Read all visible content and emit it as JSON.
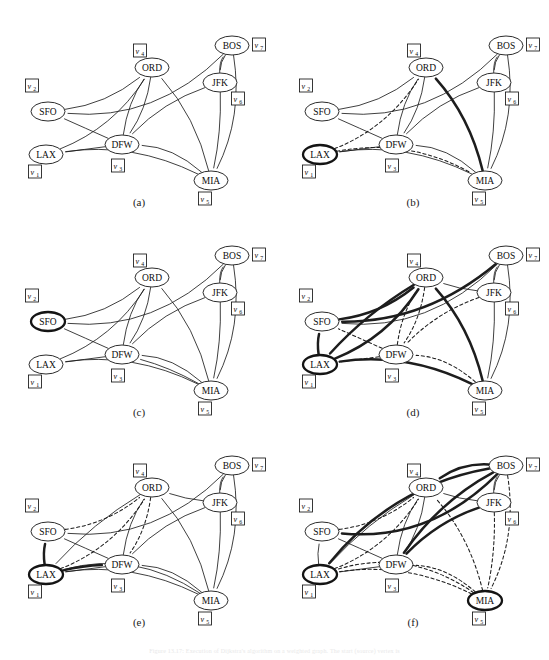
{
  "figure": {
    "type": "graph-diagram-grid",
    "panel_count": 6,
    "bottom_note": "Figure 13.17:  Execution of Dijkstra's algorithm on a weighted graph. The start (source) vertex is"
  },
  "captions": [
    "(a)",
    "(b)",
    "(c)",
    "(d)",
    "(e)",
    "(f)"
  ],
  "nodes": [
    {
      "id": "SFO",
      "label": "SFO",
      "vlabel": "v",
      "vsub": "2",
      "x": 46,
      "y": 100,
      "vx": 30,
      "vy": 74
    },
    {
      "id": "LAX",
      "label": "LAX",
      "vlabel": "v",
      "vsub": "1",
      "x": 44,
      "y": 143,
      "vx": 33,
      "vy": 160
    },
    {
      "id": "DFW",
      "label": "DFW",
      "vlabel": "v",
      "vsub": "3",
      "x": 120,
      "y": 133,
      "vx": 116,
      "vy": 154
    },
    {
      "id": "ORD",
      "label": "ORD",
      "vlabel": "v",
      "vsub": "4",
      "x": 150,
      "y": 56,
      "vx": 138,
      "vy": 39
    },
    {
      "id": "MIA",
      "label": "MIA",
      "vlabel": "v",
      "vsub": "5",
      "x": 209,
      "y": 169,
      "vx": 203,
      "vy": 187
    },
    {
      "id": "JFK",
      "label": "JFK",
      "vlabel": "v",
      "vsub": "6",
      "x": 218,
      "y": 71,
      "vx": 236,
      "vy": 87
    },
    {
      "id": "BOS",
      "label": "BOS",
      "vlabel": "v",
      "vsub": "7",
      "x": 230,
      "y": 34,
      "vx": 257,
      "vy": 33
    }
  ],
  "node_rx": 17,
  "node_ry": 9.5,
  "panels": [
    {
      "name": "a",
      "caption": "(a)",
      "highlight": [],
      "edges": [
        {
          "from": "BOS",
          "to": "SFO",
          "style": "solid",
          "bend": -46
        },
        {
          "from": "BOS",
          "to": "JFK",
          "style": "solid",
          "bend": 6
        },
        {
          "from": "JFK",
          "to": "BOS",
          "style": "solid",
          "bend": -7
        },
        {
          "from": "JFK",
          "to": "DFW",
          "style": "solid",
          "bend": 14
        },
        {
          "from": "JFK",
          "to": "MIA",
          "style": "solid",
          "bend": -6
        },
        {
          "from": "BOS",
          "to": "MIA",
          "style": "solid",
          "bend": -22
        },
        {
          "from": "MIA",
          "to": "DFW",
          "style": "solid",
          "bend": 17
        },
        {
          "from": "MIA",
          "to": "LAX",
          "style": "solid",
          "bend": 26
        },
        {
          "from": "DFW",
          "to": "ORD",
          "style": "solid",
          "bend": -10
        },
        {
          "from": "ORD",
          "to": "DFW",
          "style": "solid",
          "bend": -10
        },
        {
          "from": "MIA",
          "to": "ORD",
          "style": "solid",
          "bend": 16
        },
        {
          "from": "DFW",
          "to": "SFO",
          "style": "solid",
          "bend": 0
        },
        {
          "from": "DFW",
          "to": "LAX",
          "style": "solid",
          "bend": 0
        },
        {
          "from": "LAX",
          "to": "ORD",
          "style": "solid",
          "bend": 22
        },
        {
          "from": "SFO",
          "to": "ORD",
          "style": "solid",
          "bend": 16
        }
      ]
    },
    {
      "name": "b",
      "caption": "(b)",
      "highlight": [
        "LAX"
      ],
      "edges": [
        {
          "from": "BOS",
          "to": "SFO",
          "style": "solid",
          "bend": -46
        },
        {
          "from": "BOS",
          "to": "JFK",
          "style": "solid",
          "bend": 6
        },
        {
          "from": "JFK",
          "to": "BOS",
          "style": "solid",
          "bend": -7
        },
        {
          "from": "JFK",
          "to": "DFW",
          "style": "solid",
          "bend": 14
        },
        {
          "from": "JFK",
          "to": "MIA",
          "style": "solid",
          "bend": -6
        },
        {
          "from": "BOS",
          "to": "MIA",
          "style": "solid",
          "bend": -22
        },
        {
          "from": "MIA",
          "to": "DFW",
          "style": "solid",
          "bend": 17
        },
        {
          "from": "MIA",
          "to": "LAX",
          "style": "solid",
          "bend": 26
        },
        {
          "from": "DFW",
          "to": "ORD",
          "style": "solid",
          "bend": -10
        },
        {
          "from": "ORD",
          "to": "DFW",
          "style": "solid",
          "bend": -10
        },
        {
          "from": "MIA",
          "to": "ORD",
          "style": "bold",
          "bend": 16
        },
        {
          "from": "DFW",
          "to": "SFO",
          "style": "solid",
          "bend": 0
        },
        {
          "from": "DFW",
          "to": "LAX",
          "style": "solid",
          "bend": 0
        },
        {
          "from": "LAX",
          "to": "ORD",
          "style": "dashed",
          "bend": 22
        },
        {
          "from": "SFO",
          "to": "ORD",
          "style": "solid",
          "bend": 16
        },
        {
          "from": "LAX",
          "to": "MIA",
          "style": "dashed",
          "bend": -30
        }
      ]
    },
    {
      "name": "c",
      "caption": "(c)",
      "highlight": [
        "SFO"
      ],
      "edges": [
        {
          "from": "BOS",
          "to": "SFO",
          "style": "solid",
          "bend": -46
        },
        {
          "from": "BOS",
          "to": "JFK",
          "style": "solid",
          "bend": 6
        },
        {
          "from": "JFK",
          "to": "BOS",
          "style": "solid",
          "bend": -7
        },
        {
          "from": "JFK",
          "to": "DFW",
          "style": "solid",
          "bend": 14
        },
        {
          "from": "JFK",
          "to": "MIA",
          "style": "solid",
          "bend": -6
        },
        {
          "from": "BOS",
          "to": "MIA",
          "style": "solid",
          "bend": -22
        },
        {
          "from": "MIA",
          "to": "DFW",
          "style": "solid",
          "bend": 17
        },
        {
          "from": "MIA",
          "to": "LAX",
          "style": "solid",
          "bend": 26
        },
        {
          "from": "DFW",
          "to": "ORD",
          "style": "solid",
          "bend": -10
        },
        {
          "from": "ORD",
          "to": "DFW",
          "style": "solid",
          "bend": -10
        },
        {
          "from": "MIA",
          "to": "ORD",
          "style": "solid",
          "bend": 16
        },
        {
          "from": "DFW",
          "to": "SFO",
          "style": "solid",
          "bend": 0
        },
        {
          "from": "DFW",
          "to": "LAX",
          "style": "solid",
          "bend": 0
        },
        {
          "from": "LAX",
          "to": "ORD",
          "style": "solid",
          "bend": 22
        },
        {
          "from": "SFO",
          "to": "ORD",
          "style": "solid",
          "bend": 16
        },
        {
          "from": "MIA",
          "to": "DFW",
          "style": "solid",
          "bend": 6
        }
      ]
    },
    {
      "name": "d",
      "caption": "(d)",
      "highlight": [
        "LAX"
      ],
      "edges": [
        {
          "from": "BOS",
          "to": "SFO",
          "style": "solid",
          "bend": -46
        },
        {
          "from": "BOS",
          "to": "JFK",
          "style": "solid",
          "bend": 6
        },
        {
          "from": "JFK",
          "to": "BOS",
          "style": "solid",
          "bend": -7
        },
        {
          "from": "JFK",
          "to": "DFW",
          "style": "dashed",
          "bend": 14
        },
        {
          "from": "JFK",
          "to": "MIA",
          "style": "solid",
          "bend": -6
        },
        {
          "from": "BOS",
          "to": "MIA",
          "style": "solid",
          "bend": -22
        },
        {
          "from": "MIA",
          "to": "DFW",
          "style": "dashed",
          "bend": 17
        },
        {
          "from": "MIA",
          "to": "LAX",
          "style": "bold",
          "bend": 26
        },
        {
          "from": "DFW",
          "to": "ORD",
          "style": "dashed",
          "bend": -10
        },
        {
          "from": "ORD",
          "to": "DFW",
          "style": "dashed",
          "bend": -10
        },
        {
          "from": "MIA",
          "to": "ORD",
          "style": "bold",
          "bend": 16
        },
        {
          "from": "DFW",
          "to": "SFO",
          "style": "dashed",
          "bend": 0
        },
        {
          "from": "DFW",
          "to": "LAX",
          "style": "dashed",
          "bend": 0
        },
        {
          "from": "LAX",
          "to": "ORD",
          "style": "bold",
          "bend": 22
        },
        {
          "from": "SFO",
          "to": "ORD",
          "style": "bold",
          "bend": 16
        },
        {
          "from": "JFK",
          "to": "ORD",
          "style": "solid",
          "bend": -4
        },
        {
          "from": "BOS",
          "to": "SFO",
          "style": "bold",
          "bend": -36
        },
        {
          "from": "LAX",
          "to": "SFO",
          "style": "bold",
          "bend": -4
        },
        {
          "from": "ORD",
          "to": "LAX",
          "style": "bold",
          "bend": 10
        }
      ]
    },
    {
      "name": "e",
      "caption": "(e)",
      "highlight": [
        "LAX"
      ],
      "edges": [
        {
          "from": "BOS",
          "to": "SFO",
          "style": "solid",
          "bend": -46
        },
        {
          "from": "BOS",
          "to": "JFK",
          "style": "solid",
          "bend": 6
        },
        {
          "from": "JFK",
          "to": "BOS",
          "style": "solid",
          "bend": -7
        },
        {
          "from": "JFK",
          "to": "DFW",
          "style": "solid",
          "bend": 14
        },
        {
          "from": "JFK",
          "to": "MIA",
          "style": "solid",
          "bend": -6
        },
        {
          "from": "BOS",
          "to": "MIA",
          "style": "solid",
          "bend": -22
        },
        {
          "from": "MIA",
          "to": "DFW",
          "style": "solid",
          "bend": 17
        },
        {
          "from": "MIA",
          "to": "LAX",
          "style": "solid",
          "bend": 26
        },
        {
          "from": "DFW",
          "to": "ORD",
          "style": "solid",
          "bend": -10
        },
        {
          "from": "ORD",
          "to": "DFW",
          "style": "dashed",
          "bend": -10
        },
        {
          "from": "MIA",
          "to": "ORD",
          "style": "solid",
          "bend": 16
        },
        {
          "from": "DFW",
          "to": "SFO",
          "style": "solid",
          "bend": 0
        },
        {
          "from": "DFW",
          "to": "LAX",
          "style": "solid",
          "bend": 0
        },
        {
          "from": "LAX",
          "to": "ORD",
          "style": "dashed",
          "bend": 22
        },
        {
          "from": "SFO",
          "to": "ORD",
          "style": "dashed",
          "bend": 16
        },
        {
          "from": "JFK",
          "to": "ORD",
          "style": "solid",
          "bend": -4
        },
        {
          "from": "LAX",
          "to": "SFO",
          "style": "bold",
          "bend": -4
        },
        {
          "from": "ORD",
          "to": "LAX",
          "style": "solid",
          "bend": 10
        },
        {
          "from": "MIA",
          "to": "LAX",
          "style": "solid",
          "bend": 38
        },
        {
          "from": "LAX",
          "to": "DFW",
          "style": "bold",
          "bend": -4
        }
      ]
    },
    {
      "name": "f",
      "caption": "(f)",
      "highlight": [
        "LAX",
        "MIA"
      ],
      "edges": [
        {
          "from": "BOS",
          "to": "SFO",
          "style": "bold",
          "bend": -46
        },
        {
          "from": "BOS",
          "to": "JFK",
          "style": "solid",
          "bend": 6
        },
        {
          "from": "JFK",
          "to": "BOS",
          "style": "solid",
          "bend": -7
        },
        {
          "from": "JFK",
          "to": "DFW",
          "style": "bold",
          "bend": 14
        },
        {
          "from": "JFK",
          "to": "MIA",
          "style": "dashed",
          "bend": -6
        },
        {
          "from": "BOS",
          "to": "MIA",
          "style": "dashed",
          "bend": -22
        },
        {
          "from": "MIA",
          "to": "DFW",
          "style": "dashed",
          "bend": 17
        },
        {
          "from": "MIA",
          "to": "LAX",
          "style": "dashed",
          "bend": 26
        },
        {
          "from": "DFW",
          "to": "ORD",
          "style": "solid",
          "bend": -10
        },
        {
          "from": "ORD",
          "to": "DFW",
          "style": "solid",
          "bend": -10
        },
        {
          "from": "MIA",
          "to": "ORD",
          "style": "dashed",
          "bend": 16
        },
        {
          "from": "DFW",
          "to": "SFO",
          "style": "solid",
          "bend": 0
        },
        {
          "from": "DFW",
          "to": "LAX",
          "style": "solid",
          "bend": 0
        },
        {
          "from": "LAX",
          "to": "ORD",
          "style": "dashed",
          "bend": 22
        },
        {
          "from": "SFO",
          "to": "ORD",
          "style": "dashed",
          "bend": 16
        },
        {
          "from": "JFK",
          "to": "ORD",
          "style": "solid",
          "bend": -4
        },
        {
          "from": "LAX",
          "to": "SFO",
          "style": "solid",
          "bend": -4
        },
        {
          "from": "ORD",
          "to": "LAX",
          "style": "solid",
          "bend": 10
        },
        {
          "from": "BOS",
          "to": "ORD",
          "style": "bold",
          "bend": 14
        },
        {
          "from": "BOS",
          "to": "DFW",
          "style": "bold",
          "bend": 18
        },
        {
          "from": "BOS",
          "to": "LAX",
          "style": "bold",
          "bend": 40
        },
        {
          "from": "MIA",
          "to": "LAX",
          "style": "dashed",
          "bend": 40
        }
      ]
    }
  ]
}
